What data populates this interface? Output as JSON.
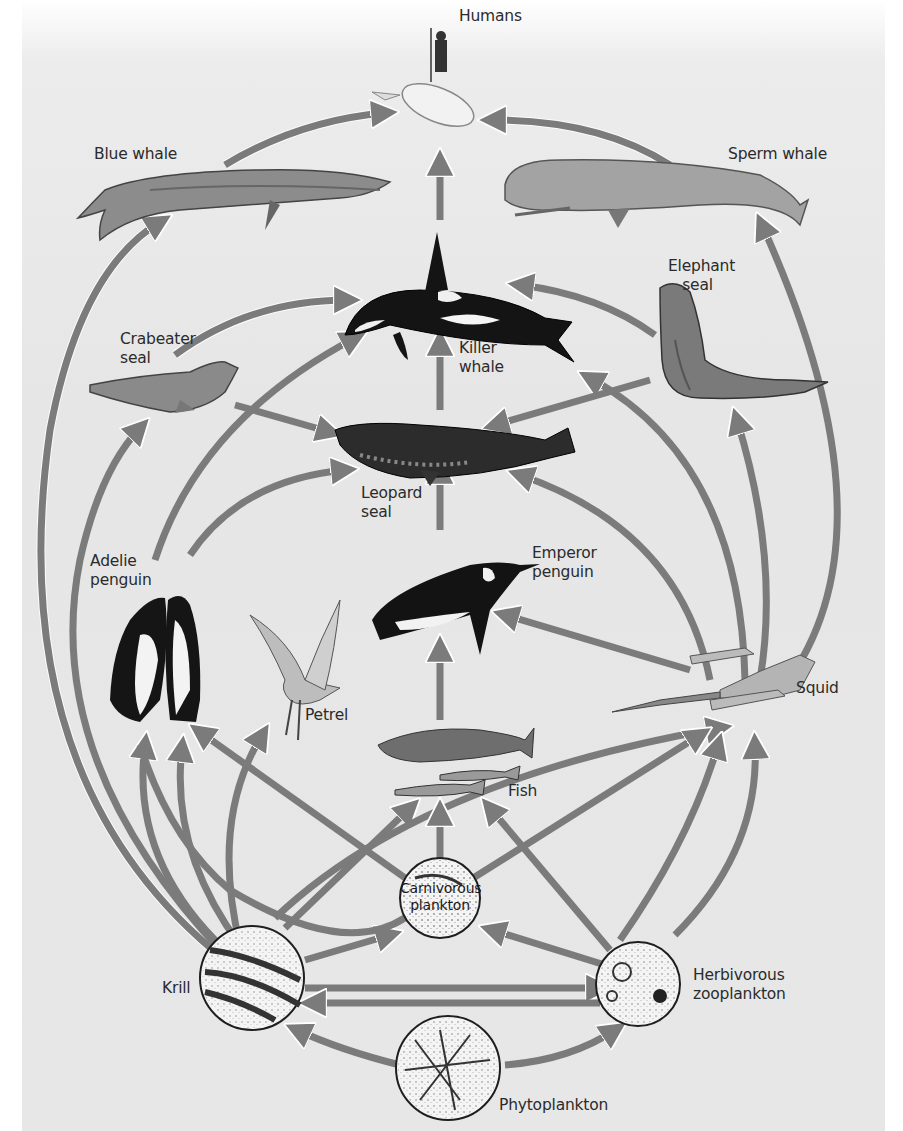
{
  "figure": {
    "colors": {
      "background": "#e7e7e7",
      "arrow": "#7b7b7b",
      "text": "#2b2b2b"
    }
  },
  "nodes": {
    "humans": {
      "label": "Humans"
    },
    "blue_whale": {
      "label": "Blue whale"
    },
    "sperm_whale": {
      "label": "Sperm whale"
    },
    "killer_whale": {
      "label": "Killer\nwhale"
    },
    "crabeater_seal": {
      "label": "Crabeater\nseal"
    },
    "elephant_seal": {
      "label": "Elephant\n   seal"
    },
    "leopard_seal": {
      "label": "Leopard\nseal"
    },
    "adelie_penguin": {
      "label": "Adelie\npenguin"
    },
    "emperor_penguin": {
      "label": "Emperor\npenguin"
    },
    "petrel": {
      "label": "Petrel"
    },
    "fish": {
      "label": "Fish"
    },
    "squid": {
      "label": "Squid"
    },
    "carnivorous_plankton": {
      "label": "Carnivorous\nplankton"
    },
    "krill": {
      "label": "Krill"
    },
    "herbivorous_zooplankton": {
      "label": "Herbivorous\nzooplankton"
    },
    "phytoplankton": {
      "label": "Phytoplankton"
    }
  },
  "edges": [
    {
      "from": "Blue whale",
      "to": "Humans"
    },
    {
      "from": "Sperm whale",
      "to": "Humans"
    },
    {
      "from": "Killer whale",
      "to": "Humans"
    },
    {
      "from": "Crabeater seal",
      "to": "Killer whale"
    },
    {
      "from": "Elephant seal",
      "to": "Killer whale"
    },
    {
      "from": "Leopard seal",
      "to": "Killer whale"
    },
    {
      "from": "Adelie penguin",
      "to": "Killer whale"
    },
    {
      "from": "Squid",
      "to": "Killer whale"
    },
    {
      "from": "Crabeater seal",
      "to": "Leopard seal"
    },
    {
      "from": "Elephant seal",
      "to": "Leopard seal"
    },
    {
      "from": "Adelie penguin",
      "to": "Leopard seal"
    },
    {
      "from": "Emperor penguin",
      "to": "Leopard seal"
    },
    {
      "from": "Squid",
      "to": "Leopard seal"
    },
    {
      "from": "Squid",
      "to": "Elephant seal"
    },
    {
      "from": "Squid",
      "to": "Sperm whale"
    },
    {
      "from": "Squid",
      "to": "Emperor penguin"
    },
    {
      "from": "Fish",
      "to": "Emperor penguin"
    },
    {
      "from": "Krill",
      "to": "Blue whale"
    },
    {
      "from": "Krill",
      "to": "Crabeater seal"
    },
    {
      "from": "Krill",
      "to": "Adelie penguin"
    },
    {
      "from": "Krill",
      "to": "Petrel"
    },
    {
      "from": "Krill",
      "to": "Fish"
    },
    {
      "from": "Krill",
      "to": "Squid"
    },
    {
      "from": "Krill",
      "to": "Carnivorous plankton"
    },
    {
      "from": "Carnivorous plankton",
      "to": "Adelie penguin"
    },
    {
      "from": "Carnivorous plankton",
      "to": "Fish"
    },
    {
      "from": "Carnivorous plankton",
      "to": "Squid"
    },
    {
      "from": "Herbivorous zooplankton",
      "to": "Carnivorous plankton"
    },
    {
      "from": "Herbivorous zooplankton",
      "to": "Fish"
    },
    {
      "from": "Herbivorous zooplankton",
      "to": "Squid"
    },
    {
      "from": "Herbivorous zooplankton",
      "to": "Krill"
    },
    {
      "from": "Phytoplankton",
      "to": "Krill"
    },
    {
      "from": "Phytoplankton",
      "to": "Herbivorous zooplankton"
    }
  ]
}
